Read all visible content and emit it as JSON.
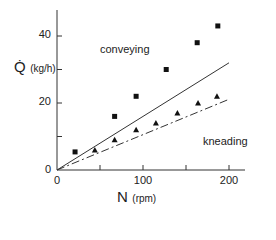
{
  "chart_data": {
    "type": "scatter",
    "title": "",
    "xlabel": "N",
    "xlabel_unit": "(rpm)",
    "ylabel": "Q̇",
    "ylabel_unit": "(kg/h)",
    "xlim": [
      0,
      220
    ],
    "ylim": [
      0,
      48
    ],
    "x_ticks": [
      0,
      50,
      100,
      150,
      200
    ],
    "x_tick_labels": [
      "0",
      "",
      "100",
      "",
      "200"
    ],
    "y_ticks": [
      0,
      10,
      20,
      30,
      40
    ],
    "y_tick_labels": [
      "0",
      "",
      "20",
      "",
      "40"
    ],
    "grid": false,
    "legend": null,
    "series": [
      {
        "name": "conveying",
        "marker": "square",
        "x": [
          21,
          67,
          92,
          127,
          163,
          187
        ],
        "y": [
          5.4,
          16,
          22,
          30,
          38,
          43
        ]
      },
      {
        "name": "kneading",
        "marker": "triangle",
        "x": [
          44,
          67,
          92,
          115,
          140,
          164,
          186
        ],
        "y": [
          6,
          9,
          12,
          14,
          17,
          20,
          22
        ]
      },
      {
        "name": "conveying-theory",
        "style": "solid-line",
        "x": [
          0,
          200
        ],
        "y": [
          0,
          32
        ]
      },
      {
        "name": "kneading-theory",
        "style": "dash-dot-line",
        "x": [
          0,
          199
        ],
        "y": [
          0,
          21
        ]
      }
    ],
    "annotations": [
      {
        "text": "conveying",
        "x": 50,
        "y": 36
      },
      {
        "text": "kneading",
        "x": 170,
        "y": 8
      }
    ]
  },
  "labels": {
    "y_main": "Q̇",
    "y_unit": "(kg/h)",
    "x_main": "N",
    "x_unit": "(rpm)",
    "annot_conveying": "conveying",
    "annot_kneading": "kneading",
    "ytick_0": "0",
    "ytick_20": "20",
    "ytick_40": "40",
    "xtick_0": "0",
    "xtick_100": "100",
    "xtick_200": "200"
  }
}
